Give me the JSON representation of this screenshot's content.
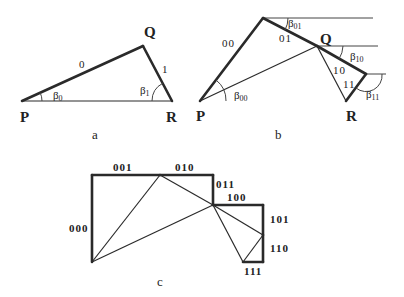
{
  "panels": {
    "a": {
      "caption": "a",
      "vertices": {
        "P": "P",
        "Q": "Q",
        "R": "R"
      },
      "edges": {
        "e0": "0",
        "e1": "1"
      },
      "angles": [
        {
          "symbol": "β",
          "sub": "0"
        },
        {
          "symbol": "β",
          "sub": "1"
        }
      ]
    },
    "b": {
      "caption": "b",
      "vertices": {
        "P": "P",
        "Q": "Q",
        "R": "R"
      },
      "edges": {
        "e00": "00",
        "e01": "01",
        "e10": "10",
        "e11": "11"
      },
      "angles": [
        {
          "symbol": "β",
          "sub": "00"
        },
        {
          "symbol": "β",
          "sub": "01"
        },
        {
          "symbol": "β",
          "sub": "10"
        },
        {
          "symbol": "β",
          "sub": "11"
        }
      ]
    },
    "c": {
      "caption": "c",
      "edges": {
        "e000": "000",
        "e001": "001",
        "e010": "010",
        "e011": "011",
        "e100": "100",
        "e101": "101",
        "e110": "110",
        "e111": "111"
      }
    }
  }
}
